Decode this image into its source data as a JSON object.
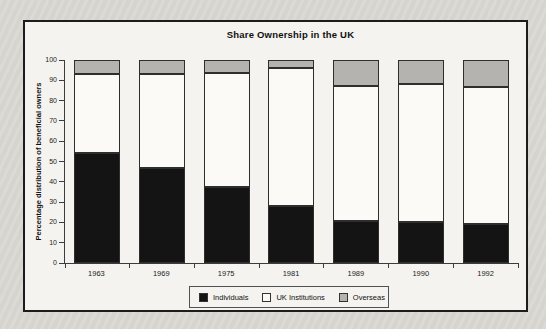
{
  "page": {
    "background_color": "#d9d8d3",
    "frame_background_color": "#f4f3ef",
    "frame_border_color": "#1c1c1c"
  },
  "chart_data": {
    "type": "bar",
    "stacked": true,
    "title": "Share Ownership in the UK",
    "xlabel": "",
    "ylabel": "Percentage distribution of beneficial owners",
    "ylim": [
      0,
      100
    ],
    "yticks": [
      0,
      10,
      20,
      30,
      40,
      50,
      60,
      70,
      80,
      90,
      100
    ],
    "grid": false,
    "legend_position": "bottom",
    "categories": [
      "1963",
      "1969",
      "1975",
      "1981",
      "1989",
      "1990",
      "1992"
    ],
    "series": [
      {
        "name": "Individuals",
        "color": "#141414",
        "values": [
          54,
          47,
          37.5,
          28,
          20.5,
          20,
          19
        ]
      },
      {
        "name": "UK Institutions",
        "color": "#fbfaf7",
        "values": [
          39,
          46,
          56,
          68,
          66.5,
          68,
          67.5
        ]
      },
      {
        "name": "Overseas",
        "color": "#b4b3af",
        "values": [
          7,
          7,
          6.5,
          4,
          13,
          12,
          13.5
        ]
      }
    ]
  }
}
